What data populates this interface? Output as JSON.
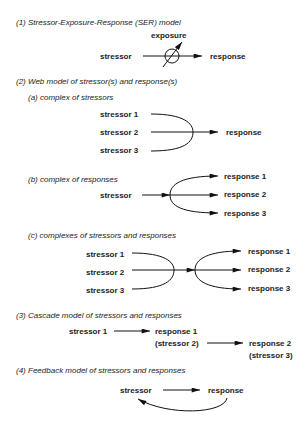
{
  "sections": {
    "s1": {
      "heading": "(1) Stressor-Exposure-Response (SER) model",
      "stressor": "stressor",
      "exposure": "exposure",
      "response": "response"
    },
    "s2": {
      "heading": "(2)  Web model of stressor(s) and response(s)",
      "a": {
        "heading": "(a)  complex of stressors",
        "stressors": [
          "stressor 1",
          "stressor 2",
          "stressor 3"
        ],
        "response": "response"
      },
      "b": {
        "heading": "(b)  complex of responses",
        "stressor": "stressor",
        "responses": [
          "response 1",
          "response 2",
          "response 3"
        ]
      },
      "c": {
        "heading": "(c)  complexes of stressors and responses",
        "stressors": [
          "stressor 1",
          "stressor 2",
          "stressor 3"
        ],
        "responses": [
          "response 1",
          "response 2",
          "response 3"
        ]
      }
    },
    "s3": {
      "heading": "(3)  Cascade model of stressors and responses",
      "stressor1": "stressor 1",
      "response1": "response 1",
      "stressor2": "(stressor 2)",
      "response2": "response 2",
      "stressor3": "(stressor 3)"
    },
    "s4": {
      "heading": "(4)  Feedback model of stressors and responses",
      "stressor": "stressor",
      "response": "response"
    }
  }
}
